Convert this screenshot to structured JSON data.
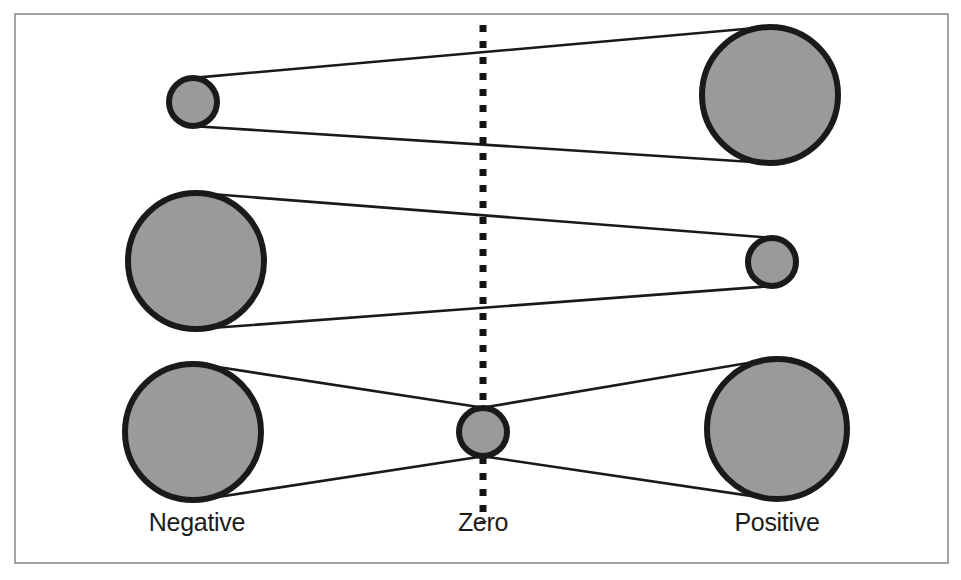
{
  "figure": {
    "background_color": "#ffffff",
    "border": {
      "name": "figure-border",
      "color": "#8c8c8c",
      "stroke_width": 1.6,
      "x": 15,
      "y": 14,
      "width": 933,
      "height": 549
    },
    "palette": {
      "circle_fill": "#9a9a9a",
      "circle_stroke": "#1a1a1a",
      "connector_stroke": "#1a1a1a",
      "zero_axis_stroke": "#141414",
      "label_color": "#1c1c1c",
      "border_color": "#8c8c8c"
    }
  },
  "zero_axis": {
    "name": "zero-axis-dotted-line",
    "x": 483,
    "y_top": 25,
    "y_bottom": 522,
    "stroke_width": 7,
    "dash_on": 7,
    "dash_off": 9,
    "color": "#141414"
  },
  "axis_labels": [
    {
      "id": "negative",
      "text": "Negative",
      "x": 197,
      "y": 531
    },
    {
      "id": "zero",
      "text": "Zero",
      "x": 483,
      "y": 531
    },
    {
      "id": "positive",
      "text": "Positive",
      "x": 777,
      "y": 531
    }
  ],
  "rows": [
    {
      "id": "row-top",
      "description": "Small negative node on the left connected to a large positive node on the right",
      "nodes": [
        {
          "id": "top-left",
          "side": "negative",
          "cx": 193,
          "cy": 102,
          "r": 24,
          "size": "small"
        },
        {
          "id": "top-right",
          "side": "positive",
          "cx": 770,
          "cy": 95,
          "r": 68,
          "size": "large"
        }
      ],
      "connectors": [
        {
          "from": "top-left",
          "to": "top-right",
          "style": "tangent-pair"
        }
      ]
    },
    {
      "id": "row-middle",
      "description": "Large negative node on the left connected to a small positive node on the right",
      "nodes": [
        {
          "id": "mid-left",
          "side": "negative",
          "cx": 196,
          "cy": 261,
          "r": 68,
          "size": "large"
        },
        {
          "id": "mid-right",
          "side": "positive",
          "cx": 772,
          "cy": 262,
          "r": 24,
          "size": "small"
        }
      ],
      "connectors": [
        {
          "from": "mid-left",
          "to": "mid-right",
          "style": "tangent-pair"
        }
      ]
    },
    {
      "id": "row-bottom",
      "description": "Large negative node and large positive node both funnelling into a small node at zero",
      "nodes": [
        {
          "id": "bot-left",
          "side": "negative",
          "cx": 193,
          "cy": 432,
          "r": 68,
          "size": "large"
        },
        {
          "id": "bot-center",
          "side": "zero",
          "cx": 483,
          "cy": 432,
          "r": 24,
          "size": "small"
        },
        {
          "id": "bot-right",
          "side": "positive",
          "cx": 777,
          "cy": 429,
          "r": 70,
          "size": "large"
        }
      ],
      "connectors": [
        {
          "from": "bot-left",
          "to": "bot-center",
          "style": "tangent-pair"
        },
        {
          "from": "bot-center",
          "to": "bot-right",
          "style": "tangent-pair"
        }
      ]
    }
  ],
  "stroke_widths": {
    "circle": 6,
    "connector": 2.6
  }
}
